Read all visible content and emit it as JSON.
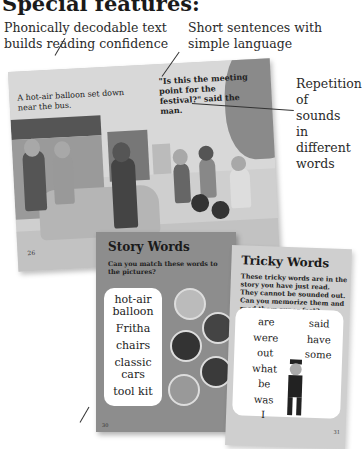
{
  "heading": "Special features:",
  "callouts": {
    "phonics": "Phonically decodable text builds reading confidence",
    "sentences": "Short sentences with simple language",
    "repetition": "Repetition of sounds in different words"
  },
  "spread": {
    "caption_left": "A hot-air balloon set down near the bus.",
    "caption_right": "\"Is this the meeting point for the festival?\" said the man.",
    "page_left": "26"
  },
  "story_words": {
    "title": "Story Words",
    "subtitle": "Can you match these words to the pictures?",
    "words": [
      "hot-air balloon",
      "Fritha",
      "chairs",
      "classic cars",
      "tool kit"
    ],
    "pictures": [
      "balloon-picture",
      "chairs-picture",
      "tool-kit-picture",
      "fritha-picture",
      "classic-car-picture"
    ],
    "page": "30"
  },
  "tricky_words": {
    "title": "Tricky Words",
    "subtitle": "These tricky words are in the story you have just read. They cannot be sounded out. Can you memorize them and read them super fast?",
    "column1": [
      "are",
      "were",
      "out",
      "what",
      "be",
      "was",
      "I"
    ],
    "column2": [
      "said",
      "have",
      "some"
    ],
    "page": "31"
  }
}
